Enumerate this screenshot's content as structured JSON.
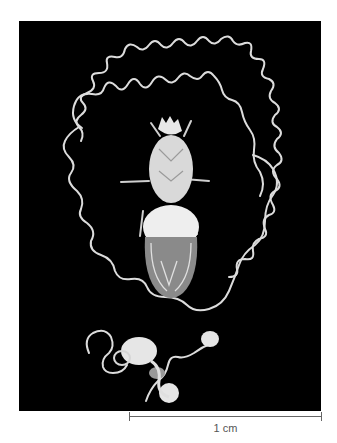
{
  "figure": {
    "scale_bar": {
      "label": "1 cm"
    },
    "colors": {
      "background": "#000000",
      "specimen": "#e8e8e8",
      "page": "#ffffff"
    }
  }
}
